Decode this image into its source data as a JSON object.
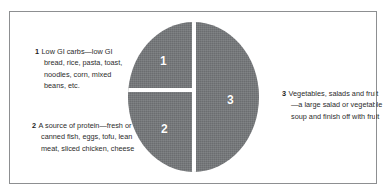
{
  "figure": {
    "kind": "plate-model-diagram",
    "border_color": "#8d8f91",
    "background_color": "#ffffff"
  },
  "plate": {
    "fill_color": "#75777a",
    "divider_color": "#ffffff",
    "label_color": "#ffffff",
    "segments": [
      {
        "number": "1",
        "share_label": "quarter",
        "position": "top-left"
      },
      {
        "number": "2",
        "share_label": "quarter",
        "position": "bottom-left"
      },
      {
        "number": "3",
        "share_label": "half",
        "position": "right"
      }
    ]
  },
  "captions": [
    {
      "marker": "1",
      "text": "Low GI carbs—low GI bread, rice, pasta, toast, noodles, corn, mixed beans, etc."
    },
    {
      "marker": "2",
      "text": "A source of protein—fresh or canned fish, eggs, tofu, lean meat, sliced chicken, cheese"
    },
    {
      "marker": "3",
      "text": "Vegetables, salads and fruit—a large salad or vegetable soup and finish off with fruit"
    }
  ],
  "chart_data": {
    "type": "pie",
    "categories": [
      "Low GI carbs",
      "A source of protein",
      "Vegetables, salads and fruit"
    ],
    "values": [
      25,
      25,
      50
    ],
    "value_unit": "percent of plate",
    "labels": [
      "1",
      "2",
      "3"
    ],
    "colors": [
      "#75777a",
      "#75777a",
      "#75777a"
    ],
    "separator_color": "#ffffff",
    "legend": "inline-callouts",
    "legend_position": "left-and-right",
    "annotations": [
      "1 Low GI carbs—low GI bread, rice, pasta, toast, noodles, corn, mixed beans, etc.",
      "2 A source of protein—fresh or canned fish, eggs, tofu, lean meat, sliced chicken, cheese",
      "3 Vegetables, salads and fruit—a large salad or vegetable soup and finish off with fruit"
    ],
    "grid": false,
    "xlabel": "",
    "ylabel": ""
  }
}
